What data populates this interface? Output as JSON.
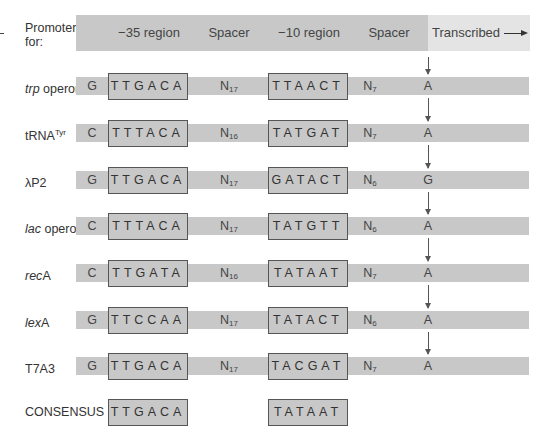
{
  "header": {
    "label": "Promoter for:",
    "columns": [
      "−35 region",
      "Spacer",
      "−10 region",
      "Spacer",
      "Transcribed"
    ]
  },
  "promoters": [
    {
      "name_italic": "trp",
      "name_rest": " operon",
      "sup": "",
      "lead": "G",
      "minus35": "TTGACA",
      "spacer1_n": "17",
      "minus10": "TTAACT",
      "spacer2_n": "7",
      "start": "A"
    },
    {
      "name_italic": "",
      "name_rest": "tRNA",
      "sup": "Tyr",
      "lead": "C",
      "minus35": "TTTACA",
      "spacer1_n": "16",
      "minus10": "TATGAT",
      "spacer2_n": "7",
      "start": "A"
    },
    {
      "name_italic": "",
      "name_rest": "λP2",
      "sup": "",
      "lead": "G",
      "minus35": "TTGACA",
      "spacer1_n": "17",
      "minus10": "GATACT",
      "spacer2_n": "6",
      "start": "G"
    },
    {
      "name_italic": "lac",
      "name_rest": " operon",
      "sup": "",
      "lead": "C",
      "minus35": "TTTACA",
      "spacer1_n": "17",
      "minus10": "TATGTT",
      "spacer2_n": "6",
      "start": "A"
    },
    {
      "name_italic": "rec",
      "name_rest": "A",
      "sup": "",
      "lead": "C",
      "minus35": "TTGATA",
      "spacer1_n": "16",
      "minus10": "TATAAT",
      "spacer2_n": "7",
      "start": "A"
    },
    {
      "name_italic": "lex",
      "name_rest": "A",
      "sup": "",
      "lead": "G",
      "minus35": "TTCCAA",
      "spacer1_n": "17",
      "minus10": "TATACT",
      "spacer2_n": "6",
      "start": "A"
    },
    {
      "name_italic": "",
      "name_rest": "T7A3",
      "sup": "",
      "lead": "G",
      "minus35": "TTGACA",
      "spacer1_n": "17",
      "minus10": "TACGAT",
      "spacer2_n": "7",
      "start": "A"
    }
  ],
  "consensus": {
    "label": "CONSENSUS",
    "minus35": "TTGACA",
    "minus10": "TATAAT"
  },
  "spacer_prefix": "N",
  "colors": {
    "bar": "#c8c8c8",
    "transcribed_bg": "#e4e4e4",
    "box_border": "#555555"
  }
}
